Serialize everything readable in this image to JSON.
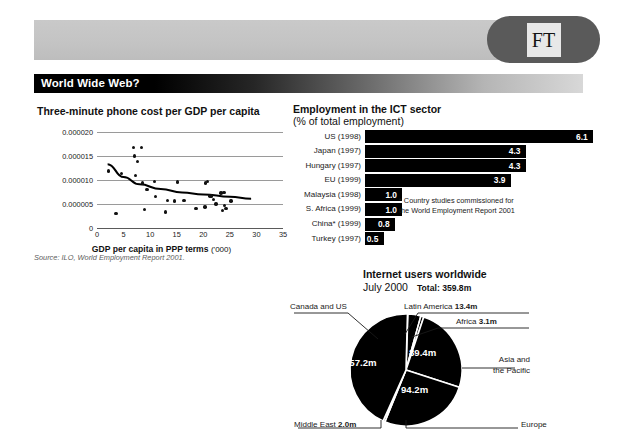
{
  "brand": {
    "logo_text": "FT"
  },
  "banner": {
    "title": "World Wide Web?"
  },
  "scatter": {
    "title": "Three-minute phone cost per GDP per capita",
    "xlabel_main": "GDP per capita in PPP terms",
    "xlabel_unit": "('000)",
    "source": "Source: ILO, World Employment Report 2001.",
    "ylabels": [
      "0.000020",
      "0.000015",
      "0.000010",
      "0.000005",
      "0"
    ],
    "xlabels": [
      "0",
      "5",
      "10",
      "15",
      "20",
      "25",
      "30",
      "35"
    ]
  },
  "bars": {
    "title": "Employment in the ICT sector",
    "subtitle": "(% of total employment)",
    "footnote": "* Country studies commissioned for the World Employment Report 2001",
    "rows": [
      {
        "label": "US (1998)",
        "value": "6.1"
      },
      {
        "label": "Japan (1997)",
        "value": "4.3"
      },
      {
        "label": "Hungary (1997)",
        "value": "4.3"
      },
      {
        "label": "EU (1999)",
        "value": "3.9"
      },
      {
        "label": "Malaysia (1998)",
        "value": "1.0"
      },
      {
        "label": "S. Africa (1999)",
        "value": "1.0"
      },
      {
        "label": "China* (1999)",
        "value": "0.8"
      },
      {
        "label": "Turkey (1997)",
        "value": "0.5"
      }
    ]
  },
  "pie": {
    "title": "Internet users worldwide",
    "date": "July 2000",
    "total": "Total: 359.8m",
    "label_canada": "Canada and US",
    "label_latin": "Latin America",
    "value_latin": "13.4m",
    "label_africa": "Africa",
    "value_africa": "3.1m",
    "label_asia_1": "Asia and",
    "label_asia_2": "the Pacific",
    "label_europe": "Europe",
    "label_me": "Middle East",
    "value_me": "2.0m",
    "value_canada": "157.2m",
    "value_asia": "89.4m",
    "value_europe": "94.2m"
  },
  "chart_data": [
    {
      "type": "scatter",
      "title": "Three-minute phone cost per GDP per capita",
      "xlabel": "GDP per capita in PPP terms ('000)",
      "ylabel": "",
      "xlim": [
        0,
        35
      ],
      "ylim": [
        0,
        2e-05
      ],
      "grid": true,
      "source": "Source: ILO, World Employment Report 2001.",
      "points": [
        [
          2.2,
          1.19e-05
        ],
        [
          3.6,
          3e-06
        ],
        [
          4.6,
          1.13e-05
        ],
        [
          6.9,
          1.68e-05
        ],
        [
          7.1,
          1.5e-05
        ],
        [
          7.2,
          1.1e-05
        ],
        [
          7.6,
          1.39e-05
        ],
        [
          8.4,
          1.68e-05
        ],
        [
          8.6,
          9.4e-06
        ],
        [
          8.9,
          3.8e-06
        ],
        [
          9.4,
          8e-06
        ],
        [
          10.8,
          9.7e-06
        ],
        [
          11.0,
          6.5e-06
        ],
        [
          12.9,
          3.3e-06
        ],
        [
          13.3,
          5.7e-06
        ],
        [
          14.6,
          5.6e-06
        ],
        [
          15.2,
          9.6e-06
        ],
        [
          16.4,
          5.7e-06
        ],
        [
          18.6,
          4e-06
        ],
        [
          20.3,
          4.4e-06
        ],
        [
          20.4,
          9.4e-06
        ],
        [
          20.8,
          9.7e-06
        ],
        [
          21.3,
          6.7e-06
        ],
        [
          21.6,
          6.7e-06
        ],
        [
          21.9,
          6e-06
        ],
        [
          22.4,
          5e-06
        ],
        [
          23.3,
          7.3e-06
        ],
        [
          23.6,
          3.6e-06
        ],
        [
          23.9,
          7.4e-06
        ],
        [
          24.0,
          4.7e-06
        ],
        [
          24.3,
          4e-06
        ],
        [
          25.2,
          5.6e-06
        ]
      ],
      "trendline": [
        [
          2.0,
          1.33e-05
        ],
        [
          5.0,
          1.06e-05
        ],
        [
          8.0,
          9.1e-06
        ],
        [
          12.0,
          8.1e-06
        ],
        [
          16.0,
          7.4e-06
        ],
        [
          20.0,
          7e-06
        ],
        [
          25.0,
          6.5e-06
        ],
        [
          29.0,
          6.1e-06
        ]
      ]
    },
    {
      "type": "bar",
      "title": "Employment in the ICT sector",
      "subtitle": "(% of total employment)",
      "orientation": "horizontal",
      "categories": [
        "US (1998)",
        "Japan (1997)",
        "Hungary (1997)",
        "EU (1999)",
        "Malaysia (1998)",
        "S. Africa (1999)",
        "China* (1999)",
        "Turkey (1997)"
      ],
      "values": [
        6.1,
        4.3,
        4.3,
        3.9,
        1.0,
        1.0,
        0.8,
        0.5
      ],
      "xlabel": "",
      "ylabel": "",
      "xlim": [
        0,
        6.1
      ],
      "grid": false
    },
    {
      "type": "pie",
      "title": "Internet users worldwide",
      "subtitle": "July 2000",
      "total": 359.8,
      "unit": "m",
      "labels": [
        "Canada and US",
        "Europe",
        "Asia and the Pacific",
        "Latin America",
        "Africa",
        "Middle East"
      ],
      "values": [
        157.2,
        94.2,
        89.4,
        13.4,
        3.1,
        2.0
      ]
    }
  ]
}
